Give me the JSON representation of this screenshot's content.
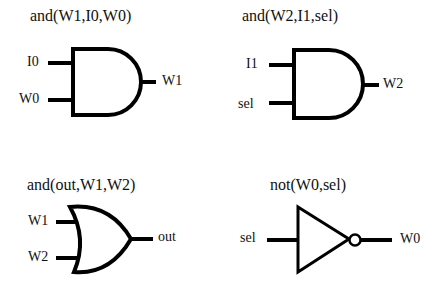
{
  "gates": [
    {
      "id": "g1",
      "type": "and",
      "title": "and(W1,I0,W0)",
      "inputs": [
        "I0",
        "W0"
      ],
      "output": "W1"
    },
    {
      "id": "g2",
      "type": "and",
      "title": "and(W2,I1,sel)",
      "inputs": [
        "I1",
        "sel"
      ],
      "output": "W2"
    },
    {
      "id": "g3",
      "type": "or",
      "title": "and(out,W1,W2)",
      "inputs": [
        "W1",
        "W2"
      ],
      "output": "out"
    },
    {
      "id": "g4",
      "type": "not",
      "title": "not(W0,sel)",
      "inputs": [
        "sel"
      ],
      "output": "W0"
    }
  ],
  "colors": {
    "stroke": "#000000",
    "background": "#ffffff",
    "text": "#111111"
  }
}
